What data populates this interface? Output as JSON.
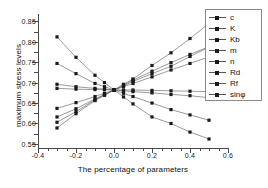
{
  "chart_data": {
    "type": "line",
    "title": "",
    "xlabel": "The percentage of parameters",
    "ylabel": "maximum stress levels",
    "xlim": [
      -0.4,
      0.6
    ],
    "ylim": [
      0.54,
      0.868
    ],
    "xticks": [
      -0.4,
      -0.2,
      0.0,
      0.2,
      0.4,
      0.6
    ],
    "xticklabels": [
      "-0.4",
      "-0.2",
      "0.0",
      "0.2",
      "0.4",
      "0.6"
    ],
    "xminorticks": [
      -0.35,
      -0.3,
      -0.25,
      -0.15,
      -0.1,
      -0.05,
      0.05,
      0.1,
      0.15,
      0.25,
      0.3,
      0.35,
      0.45,
      0.5,
      0.55
    ],
    "yticks": [
      0.55,
      0.6,
      0.65,
      0.7,
      0.75,
      0.8,
      0.85
    ],
    "yticklabels": [
      "0.55",
      "0.60",
      "0.65",
      "0.70",
      "0.75",
      "0.80",
      "0.85"
    ],
    "yminorticks": [
      0.575,
      0.625,
      0.675,
      0.725,
      0.775,
      0.825
    ],
    "grid": false,
    "legend_position": "upper right",
    "marker": "square",
    "convergence_point": [
      0.0,
      0.682
    ],
    "x": [
      -0.3,
      -0.2,
      -0.1,
      -0.05,
      0.0,
      0.05,
      0.1,
      0.2,
      0.3,
      0.4,
      0.5
    ],
    "series": [
      {
        "name": "c",
        "values": [
          0.812,
          0.762,
          0.718,
          0.7,
          0.682,
          0.665,
          0.648,
          0.616,
          0.6,
          0.579,
          0.562
        ]
      },
      {
        "name": "K",
        "values": [
          0.747,
          0.722,
          0.698,
          0.69,
          0.682,
          0.674,
          0.666,
          0.65,
          0.634,
          0.621,
          0.608
        ]
      },
      {
        "name": "Kb",
        "values": [
          0.696,
          0.69,
          0.686,
          0.684,
          0.682,
          0.68,
          0.678,
          0.675,
          0.671,
          0.668,
          0.663
        ]
      },
      {
        "name": "m",
        "values": [
          0.686,
          0.684,
          0.683,
          0.683,
          0.682,
          0.682,
          0.682,
          0.681,
          0.68,
          0.679,
          0.678
        ]
      },
      {
        "name": "n",
        "values": [
          0.637,
          0.651,
          0.666,
          0.674,
          0.682,
          0.69,
          0.698,
          0.714,
          0.731,
          0.747,
          0.763
        ]
      },
      {
        "name": "Rd",
        "values": [
          0.616,
          0.636,
          0.66,
          0.671,
          0.682,
          0.692,
          0.703,
          0.722,
          0.74,
          0.764,
          0.787
        ]
      },
      {
        "name": "Rf",
        "values": [
          0.603,
          0.629,
          0.658,
          0.67,
          0.682,
          0.694,
          0.706,
          0.728,
          0.749,
          0.769,
          0.788
        ]
      },
      {
        "name": "sinφ",
        "values": [
          0.589,
          0.624,
          0.656,
          0.669,
          0.682,
          0.696,
          0.709,
          0.742,
          0.773,
          0.808,
          0.845
        ]
      }
    ]
  },
  "legend": {
    "items": [
      {
        "label": "c"
      },
      {
        "label": "K"
      },
      {
        "label": "Kb"
      },
      {
        "label": "m"
      },
      {
        "label": "n"
      },
      {
        "label": "Rd"
      },
      {
        "label": "Rf"
      },
      {
        "label": "sinφ"
      }
    ]
  },
  "colors": {
    "line": "#555555",
    "marker": "#1a1a1a",
    "axis": "#4a4a4a",
    "text": "#111111",
    "background": "#ffffff"
  }
}
